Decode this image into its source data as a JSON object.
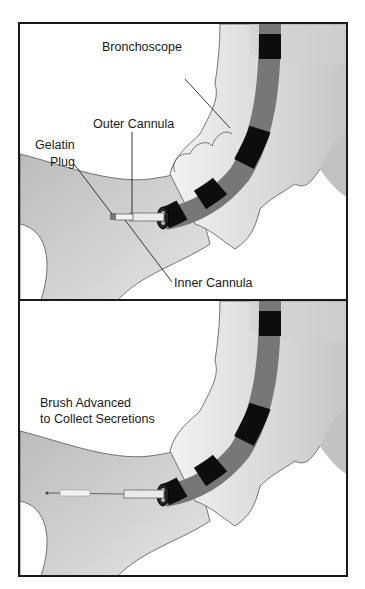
{
  "figure": {
    "panels": [
      {
        "id": "top",
        "labels": {
          "bronchoscope": "Bronchoscope",
          "outer_cannula": "Outer Cannula",
          "gelatin_plug_line1": "Gelatin",
          "gelatin_plug_line2": "Plug",
          "inner_cannula": "Inner Cannula"
        }
      },
      {
        "id": "bottom",
        "labels": {
          "caption_line1": "Brush Advanced",
          "caption_line2": "to Collect Secretions"
        }
      }
    ],
    "colors": {
      "frame": "#1a1a1a",
      "airway_fill": "#c8c8c8",
      "airway_light": "#ececec",
      "scope_dark": "#0d0d0d",
      "scope_mid": "#6e6e6e",
      "background": "#ffffff"
    }
  }
}
